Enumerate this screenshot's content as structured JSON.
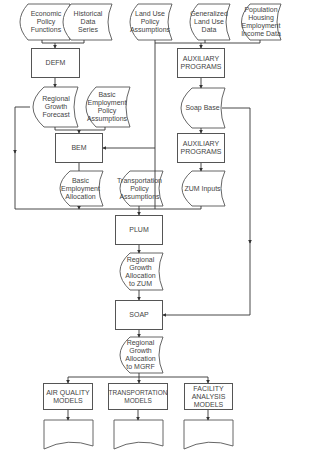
{
  "diagram": {
    "type": "flowchart",
    "inputs_top": [
      {
        "id": "econ",
        "label": "Economic\nPolicy\nFunctions",
        "shape": "stored-data"
      },
      {
        "id": "hist",
        "label": "Historical\nData\nSeries",
        "shape": "stored-data"
      },
      {
        "id": "lupa",
        "label": "Land Use\nPolicy\nAssumptions",
        "shape": "stored-data"
      },
      {
        "id": "glud",
        "label": "Generalized\nLand Use\nData",
        "shape": "stored-data"
      },
      {
        "id": "phei",
        "label": "Population\nHousing\nEmployment\nIncome Data",
        "shape": "stored-data"
      }
    ],
    "processes": {
      "defm": "DEFM",
      "aux1": "AUXILIARY\nPROGRAMS",
      "bem": "BEM",
      "aux2": "AUXILIARY\nPROGRAMS",
      "plum": "PLUM",
      "soap": "SOAP",
      "airq": "AIR QUALITY\nMODELS",
      "trans": "TRANSPORTATION\nMODELS",
      "facil": "FACILITY\nANALYSIS\nMODELS"
    },
    "data_nodes": {
      "rgf": "Regional\nGrowth\nForecast",
      "bepa": "Basic\nEmployment\nPolicy\nAssumptions",
      "soapbase": "Soap Base",
      "bea": "Basic\nEmployment\nAllocation",
      "tpa": "Transportation\nPolicy\nAssumptions",
      "zum": "ZUM Inputs",
      "rgazum": "Regional\nGrowth\nAllocation\nto ZUM",
      "rgamgrf": "Regional\nGrowth\nAllocation\nto MGRF"
    },
    "outputs": [
      {
        "id": "out1",
        "label": "",
        "shape": "document"
      },
      {
        "id": "out2",
        "label": "",
        "shape": "document"
      },
      {
        "id": "out3",
        "label": "",
        "shape": "document"
      }
    ],
    "edges": [
      [
        "Economic Policy Functions",
        "DEFM"
      ],
      [
        "Historical Data Series",
        "DEFM"
      ],
      [
        "DEFM",
        "Regional Growth Forecast"
      ],
      [
        "Regional Growth Forecast",
        "BEM"
      ],
      [
        "Basic Employment Policy Assumptions",
        "BEM"
      ],
      [
        "Regional Growth Forecast",
        "PLUM"
      ],
      [
        "Land Use Policy Assumptions",
        "PLUM"
      ],
      [
        "Generalized Land Use Data",
        "AUXILIARY PROGRAMS"
      ],
      [
        "Population Housing Employment Income Data",
        "AUXILIARY PROGRAMS"
      ],
      [
        "AUXILIARY PROGRAMS",
        "Soap Base"
      ],
      [
        "Soap Base",
        "AUXILIARY PROGRAMS (2)"
      ],
      [
        "Soap Base",
        "SOAP"
      ],
      [
        "AUXILIARY PROGRAMS (2)",
        "ZUM Inputs"
      ],
      [
        "AUXILIARY PROGRAMS (2)",
        "BEM"
      ],
      [
        "BEM",
        "Basic Employment Allocation"
      ],
      [
        "Basic Employment Allocation",
        "PLUM"
      ],
      [
        "Transportation Policy Assumptions",
        "PLUM"
      ],
      [
        "ZUM Inputs",
        "PLUM"
      ],
      [
        "PLUM",
        "Regional Growth Allocation to ZUM"
      ],
      [
        "Regional Growth Allocation to ZUM",
        "SOAP"
      ],
      [
        "SOAP",
        "Regional Growth Allocation to MGRF"
      ],
      [
        "Regional Growth Allocation to MGRF",
        "AIR QUALITY MODELS"
      ],
      [
        "Regional Growth Allocation to MGRF",
        "TRANSPORTATION MODELS"
      ],
      [
        "Regional Growth Allocation to MGRF",
        "FACILITY ANALYSIS MODELS"
      ],
      [
        "AIR QUALITY MODELS",
        "Output 1"
      ],
      [
        "TRANSPORTATION MODELS",
        "Output 2"
      ],
      [
        "FACILITY ANALYSIS MODELS",
        "Output 3"
      ]
    ]
  }
}
